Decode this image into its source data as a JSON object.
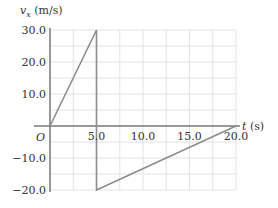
{
  "chart_data": {
    "type": "line",
    "title": "",
    "xlabel": "t (s)",
    "ylabel": "v_x (m/s)",
    "xlim": [
      0,
      20
    ],
    "ylim": [
      -20,
      30
    ],
    "grid": true,
    "origin_label": "O",
    "x_ticks": [
      5.0,
      10.0,
      15.0,
      20.0
    ],
    "x_tick_labels": [
      "5.0",
      "10.0",
      "15.0",
      "20.0"
    ],
    "y_ticks": [
      30.0,
      20.0,
      10.0,
      -10.0,
      -20.0
    ],
    "y_tick_labels": [
      "30.0",
      "20.0",
      "10.0",
      "−10.0",
      "−20.0"
    ],
    "series": [
      {
        "name": "v_x",
        "x": [
          0,
          5.0,
          5.0,
          20.0
        ],
        "y": [
          0,
          30.0,
          -20.0,
          0
        ]
      }
    ],
    "colors": {
      "line": "#8c8c8c",
      "axis": "#7a7a7a",
      "grid": "#e3e3e3"
    }
  }
}
